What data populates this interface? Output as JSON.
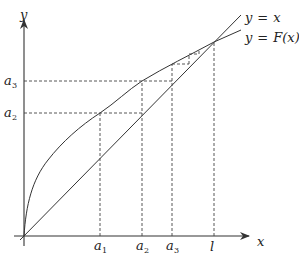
{
  "diagram": {
    "type": "cobweb-fixed-point-iteration",
    "axes": {
      "x_label": "x",
      "y_label": "y"
    },
    "curves": [
      {
        "name": "identity-line",
        "label_lhs": "y",
        "label_eq": "=",
        "label_rhs": "x"
      },
      {
        "name": "F-curve",
        "label_lhs": "y",
        "label_eq": "=",
        "label_rhs": "F(x)"
      }
    ],
    "x_ticks": [
      {
        "base": "a",
        "sub": "1"
      },
      {
        "base": "a",
        "sub": "2"
      },
      {
        "base": "a",
        "sub": "3"
      },
      {
        "base": "l",
        "sub": ""
      }
    ],
    "y_ticks": [
      {
        "base": "a",
        "sub": "3"
      },
      {
        "base": "a",
        "sub": "2"
      }
    ],
    "colors": {
      "stroke": "#333333",
      "dashed": "#444444",
      "background": "#ffffff"
    }
  }
}
